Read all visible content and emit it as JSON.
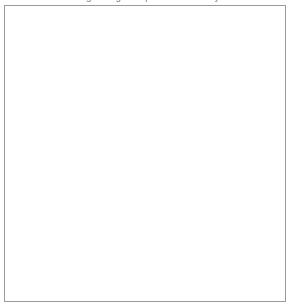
{
  "figure": {
    "domain": "medical-illustration",
    "subject": "Drug-eluting stent placed in an artery",
    "top_caption": "Drug-eluting stent placed in an artery",
    "frame_color": "#9a9a9a",
    "background_color": "#ffffff",
    "palette": {
      "artery_light": "#e8e8e8",
      "artery_mid": "#b4b4b4",
      "artery_dark": "#6e6e6e",
      "artery_darkest": "#3a3a3a",
      "stent_outline": "#1d1d1d",
      "arrow": "#5a5a5a",
      "text": "#111111",
      "leader_line": "#2f2f2f"
    }
  },
  "labels": [
    {
      "id": "catheter",
      "name": "label-catheter",
      "text": "Catheter",
      "points_to": "catheter tube entering the artery"
    },
    {
      "id": "stent",
      "name": "label-stent",
      "text": "Stent",
      "points_to": "expanded wire mesh stent"
    },
    {
      "id": "balloon",
      "name": "label-balloon",
      "text": "Balloon inflates to place stent",
      "points_to": "inflated balloon at distal end"
    },
    {
      "id": "polymer",
      "name": "label-polymer-coating",
      "text": "Polymer coating covering stent releases drugs into artery wall",
      "points_to": "magnified stent strut in inset circle"
    },
    {
      "id": "props",
      "name": "label-stent-props",
      "text": "Stent props the artery open",
      "points_to": "stent holding artery lumen open"
    }
  ],
  "insets": [
    {
      "id": "magnifier-small",
      "name": "magnifier-circle-small",
      "description": "Small circular callout ring over the stent strut on the artery"
    },
    {
      "id": "magnifier-large",
      "name": "magnifier-circle-large",
      "description": "Large magnified view of stent struts with drug-release arrows"
    }
  ],
  "arrows": {
    "name": "drug-release-arrows",
    "count": 4,
    "description": "Grey arrows showing drug diffusing outward from the polymer coated strut",
    "directions": [
      "left",
      "right",
      "left",
      "right"
    ]
  }
}
